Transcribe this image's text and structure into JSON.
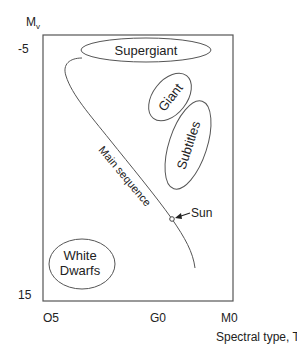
{
  "diagram": {
    "type": "Hertzsprung-Russell diagram",
    "y_axis": {
      "label_main": "M",
      "label_sub": "v",
      "ticks": [
        "-5",
        "15"
      ]
    },
    "x_axis": {
      "label": "Spectral type, T",
      "ticks": [
        "O5",
        "G0",
        "M0"
      ]
    },
    "regions": {
      "supergiant": "Supergiant",
      "giant": "Giant",
      "subtitles": "Subtitles",
      "white_dwarfs_line1": "White",
      "white_dwarfs_line2": "Dwarfs"
    },
    "main_sequence_label": "Main sequence",
    "sun_label": "Sun",
    "colors": {
      "line": "#555555",
      "text": "#222222",
      "background": "#ffffff"
    }
  }
}
